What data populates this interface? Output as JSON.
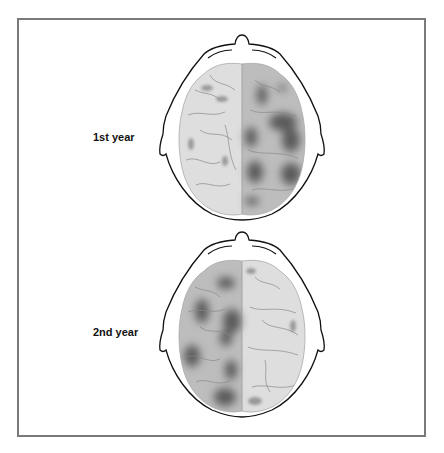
{
  "figure": {
    "panels": [
      {
        "label": "1st year",
        "affected_hemisphere": "right",
        "lesion_intensity": "heavy"
      },
      {
        "label": "2nd year",
        "affected_hemisphere": "left",
        "lesion_intensity": "heavy"
      }
    ],
    "colors": {
      "frame": "#7a7a7a",
      "outline": "#111111",
      "brain_light": "#dcdcdc",
      "brain_shaded": "#b5b5b5",
      "lesion": "#4a4a4a",
      "sulci": "#8a8a8a"
    }
  }
}
